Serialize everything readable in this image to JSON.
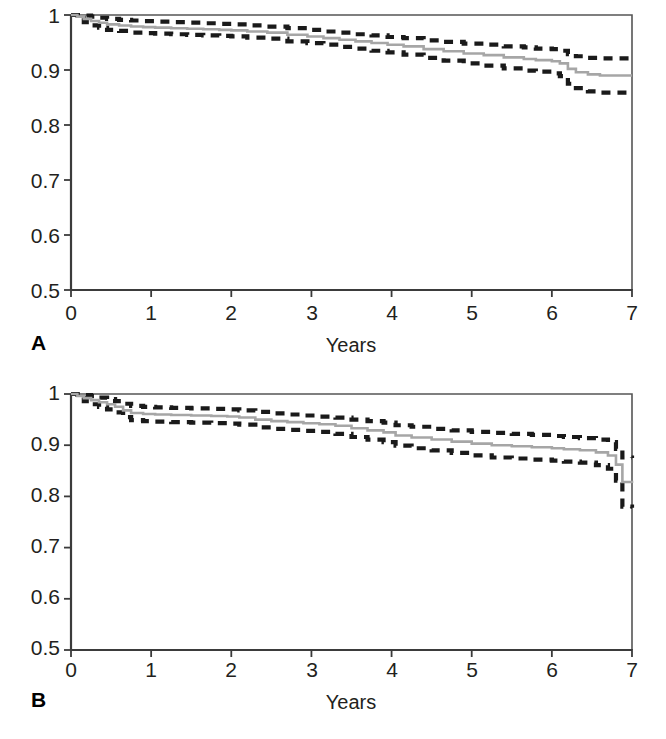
{
  "figure": {
    "background": "#ffffff",
    "panels": [
      {
        "letter": "A",
        "xlabel": "Years",
        "ylabel": "",
        "yticks": [
          "1",
          "0.9",
          "0.8",
          "0.7",
          "0.6",
          "0.5"
        ],
        "xticks": [
          "0",
          "1",
          "2",
          "3",
          "4",
          "5",
          "6",
          "7"
        ]
      },
      {
        "letter": "B",
        "xlabel": "Years",
        "ylabel": "",
        "yticks": [
          "1",
          "0.9",
          "0.8",
          "0.7",
          "0.6",
          "0.5"
        ],
        "xticks": [
          "0",
          "1",
          "2",
          "3",
          "4",
          "5",
          "6",
          "7"
        ]
      }
    ]
  },
  "colors": {
    "curve": "#a6a6a6",
    "confidence_band": "#1a1a1a",
    "axis": "#3b3b3b",
    "text": "#231f20"
  },
  "chart_data": [
    {
      "id": "panel-a",
      "type": "line",
      "title": "",
      "subtitle": "",
      "xlabel": "Years",
      "ylabel": "",
      "xlim": [
        0,
        7
      ],
      "ylim": [
        0.5,
        1.0
      ],
      "xticks": [
        0,
        1,
        2,
        3,
        4,
        5,
        6,
        7
      ],
      "yticks": [
        0.5,
        0.6,
        0.7,
        0.8,
        0.9,
        1.0
      ],
      "grid": false,
      "legend": "none",
      "annotations": [
        "A"
      ],
      "series": [
        {
          "name": "Survival estimate",
          "style": "solid",
          "color": "#a6a6a6",
          "x": [
            0.0,
            0.08,
            0.16,
            0.25,
            0.35,
            0.45,
            0.6,
            0.75,
            0.9,
            1.05,
            1.25,
            1.45,
            1.65,
            1.85,
            2.0,
            2.2,
            2.45,
            2.7,
            2.95,
            3.15,
            3.35,
            3.55,
            3.75,
            3.95,
            4.15,
            4.4,
            4.65,
            4.9,
            5.15,
            5.4,
            5.65,
            5.8,
            6.0,
            6.1,
            6.2,
            6.3,
            6.45,
            6.6,
            7.0
          ],
          "y": [
            1.0,
            0.997,
            0.993,
            0.989,
            0.986,
            0.983,
            0.981,
            0.979,
            0.978,
            0.977,
            0.976,
            0.975,
            0.974,
            0.973,
            0.972,
            0.97,
            0.968,
            0.964,
            0.961,
            0.958,
            0.955,
            0.952,
            0.949,
            0.946,
            0.943,
            0.938,
            0.934,
            0.93,
            0.927,
            0.923,
            0.92,
            0.918,
            0.916,
            0.912,
            0.902,
            0.896,
            0.892,
            0.89,
            0.89
          ]
        },
        {
          "name": "Upper 95% confidence limit",
          "style": "dashed",
          "color": "#1a1a1a",
          "x": [
            0.0,
            0.08,
            0.16,
            0.25,
            0.35,
            0.45,
            0.6,
            0.75,
            0.9,
            1.05,
            1.25,
            1.45,
            1.65,
            1.85,
            2.0,
            2.2,
            2.45,
            2.7,
            2.95,
            3.15,
            3.35,
            3.55,
            3.75,
            3.95,
            4.15,
            4.4,
            4.65,
            4.9,
            5.15,
            5.4,
            5.65,
            5.8,
            6.0,
            6.1,
            6.2,
            6.3,
            6.45,
            6.6,
            7.0
          ],
          "y": [
            1.0,
            1.0,
            0.999,
            0.997,
            0.995,
            0.993,
            0.991,
            0.99,
            0.989,
            0.988,
            0.987,
            0.986,
            0.985,
            0.984,
            0.983,
            0.981,
            0.979,
            0.976,
            0.973,
            0.97,
            0.968,
            0.965,
            0.963,
            0.96,
            0.958,
            0.954,
            0.951,
            0.948,
            0.946,
            0.943,
            0.941,
            0.939,
            0.938,
            0.935,
            0.929,
            0.925,
            0.922,
            0.921,
            0.921
          ]
        },
        {
          "name": "Lower 95% confidence limit",
          "style": "dashed",
          "color": "#1a1a1a",
          "x": [
            0.0,
            0.08,
            0.16,
            0.25,
            0.35,
            0.45,
            0.6,
            0.75,
            0.9,
            1.05,
            1.25,
            1.45,
            1.65,
            1.85,
            2.0,
            2.2,
            2.45,
            2.7,
            2.95,
            3.15,
            3.35,
            3.55,
            3.75,
            3.95,
            4.15,
            4.4,
            4.65,
            4.9,
            5.15,
            5.4,
            5.65,
            5.8,
            6.0,
            6.1,
            6.2,
            6.3,
            6.45,
            6.6,
            7.0
          ],
          "y": [
            1.0,
            0.994,
            0.987,
            0.981,
            0.977,
            0.973,
            0.971,
            0.968,
            0.967,
            0.966,
            0.965,
            0.964,
            0.963,
            0.962,
            0.961,
            0.959,
            0.957,
            0.952,
            0.949,
            0.946,
            0.942,
            0.939,
            0.935,
            0.932,
            0.928,
            0.922,
            0.917,
            0.912,
            0.908,
            0.903,
            0.899,
            0.897,
            0.894,
            0.889,
            0.875,
            0.867,
            0.861,
            0.859,
            0.859
          ]
        }
      ]
    },
    {
      "id": "panel-b",
      "type": "line",
      "title": "",
      "subtitle": "",
      "xlabel": "Years",
      "ylabel": "",
      "xlim": [
        0,
        7
      ],
      "ylim": [
        0.5,
        1.0
      ],
      "xticks": [
        0,
        1,
        2,
        3,
        4,
        5,
        6,
        7
      ],
      "yticks": [
        0.5,
        0.6,
        0.7,
        0.8,
        0.9,
        1.0
      ],
      "grid": false,
      "legend": "none",
      "annotations": [
        "B"
      ],
      "series": [
        {
          "name": "Survival estimate",
          "style": "solid",
          "color": "#a6a6a6",
          "x": [
            0.0,
            0.08,
            0.16,
            0.25,
            0.35,
            0.45,
            0.55,
            0.65,
            0.75,
            0.9,
            1.05,
            1.25,
            1.5,
            1.75,
            1.95,
            2.1,
            2.3,
            2.5,
            2.7,
            2.9,
            3.1,
            3.3,
            3.5,
            3.7,
            3.9,
            4.05,
            4.25,
            4.5,
            4.75,
            5.0,
            5.25,
            5.5,
            5.75,
            6.0,
            6.15,
            6.35,
            6.55,
            6.7,
            6.8,
            6.88,
            7.0
          ],
          "y": [
            1.0,
            0.996,
            0.992,
            0.988,
            0.984,
            0.98,
            0.975,
            0.968,
            0.963,
            0.961,
            0.96,
            0.959,
            0.958,
            0.957,
            0.956,
            0.954,
            0.95,
            0.947,
            0.945,
            0.943,
            0.941,
            0.938,
            0.933,
            0.929,
            0.925,
            0.919,
            0.915,
            0.911,
            0.907,
            0.903,
            0.9,
            0.898,
            0.896,
            0.894,
            0.892,
            0.89,
            0.886,
            0.88,
            0.862,
            0.828,
            0.826
          ]
        },
        {
          "name": "Upper 95% confidence limit",
          "style": "dashed",
          "color": "#1a1a1a",
          "x": [
            0.0,
            0.08,
            0.16,
            0.25,
            0.35,
            0.45,
            0.55,
            0.65,
            0.75,
            0.9,
            1.05,
            1.25,
            1.5,
            1.75,
            1.95,
            2.1,
            2.3,
            2.5,
            2.7,
            2.9,
            3.1,
            3.3,
            3.5,
            3.7,
            3.9,
            4.05,
            4.25,
            4.5,
            4.75,
            5.0,
            5.25,
            5.5,
            5.75,
            6.0,
            6.15,
            6.35,
            6.55,
            6.7,
            6.8,
            6.88,
            7.0
          ],
          "y": [
            1.0,
            0.999,
            0.998,
            0.996,
            0.993,
            0.99,
            0.986,
            0.981,
            0.977,
            0.975,
            0.974,
            0.973,
            0.972,
            0.971,
            0.97,
            0.968,
            0.965,
            0.962,
            0.96,
            0.958,
            0.956,
            0.954,
            0.95,
            0.947,
            0.944,
            0.939,
            0.936,
            0.932,
            0.929,
            0.926,
            0.924,
            0.922,
            0.92,
            0.918,
            0.916,
            0.914,
            0.911,
            0.906,
            0.893,
            0.876,
            0.875
          ]
        },
        {
          "name": "Lower 95% confidence limit",
          "style": "dashed",
          "color": "#1a1a1a",
          "x": [
            0.0,
            0.08,
            0.16,
            0.25,
            0.35,
            0.45,
            0.55,
            0.65,
            0.75,
            0.9,
            1.05,
            1.25,
            1.5,
            1.75,
            1.95,
            2.1,
            2.3,
            2.5,
            2.7,
            2.9,
            3.1,
            3.3,
            3.5,
            3.7,
            3.9,
            4.05,
            4.25,
            4.5,
            4.75,
            5.0,
            5.25,
            5.5,
            5.75,
            6.0,
            6.15,
            6.35,
            6.55,
            6.7,
            6.8,
            6.88,
            7.0
          ],
          "y": [
            1.0,
            0.993,
            0.986,
            0.98,
            0.975,
            0.97,
            0.964,
            0.955,
            0.949,
            0.947,
            0.946,
            0.945,
            0.944,
            0.943,
            0.942,
            0.94,
            0.935,
            0.932,
            0.93,
            0.928,
            0.926,
            0.922,
            0.916,
            0.911,
            0.906,
            0.899,
            0.894,
            0.89,
            0.885,
            0.88,
            0.876,
            0.874,
            0.872,
            0.87,
            0.868,
            0.866,
            0.861,
            0.854,
            0.831,
            0.78,
            0.778
          ]
        }
      ]
    }
  ],
  "bleed_through": {
    "visible": true,
    "note": ""
  }
}
